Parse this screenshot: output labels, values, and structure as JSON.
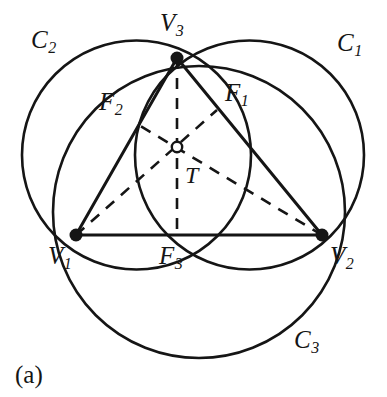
{
  "figure": {
    "caption": "(a)",
    "stroke_color": "#151515",
    "background_color": "#ffffff",
    "canvas": {
      "width": 387,
      "height": 397
    }
  },
  "circles": [
    {
      "id": "C1",
      "label_base": "C",
      "label_sub": "1",
      "label_x": 337,
      "label_y": 30,
      "cx": 249.5,
      "cy": 155,
      "r": 114.5,
      "style": "solid"
    },
    {
      "id": "C2",
      "label_base": "C",
      "label_sub": "2",
      "label_x": 31,
      "label_y": 27,
      "cx": 136.5,
      "cy": 155,
      "r": 114.5,
      "style": "solid"
    },
    {
      "id": "C3",
      "label_base": "C",
      "label_sub": "3",
      "label_x": 294,
      "label_y": 327,
      "cx": 199,
      "cy": 212,
      "r": 146,
      "style": "solid"
    }
  ],
  "vertices": [
    {
      "id": "V1",
      "label_base": "V",
      "label_sub": "1",
      "x": 76,
      "y": 235,
      "label_x": 48,
      "label_y": 243,
      "marker": "filled-dot"
    },
    {
      "id": "V2",
      "label_base": "V",
      "label_sub": "2",
      "x": 322,
      "y": 235,
      "label_x": 330,
      "label_y": 243,
      "marker": "filled-dot"
    },
    {
      "id": "V3",
      "label_base": "V",
      "label_sub": "3",
      "x": 177,
      "y": 58,
      "label_x": 160,
      "label_y": 10,
      "marker": "filled-dot"
    }
  ],
  "intersection_points": [
    {
      "id": "F1",
      "label_base": "F",
      "label_sub": "1",
      "x": 217,
      "y": 110,
      "label_x": 225,
      "label_y": 80,
      "marker": "none"
    },
    {
      "id": "F2",
      "label_base": "F",
      "label_sub": "2",
      "x": 137,
      "y": 124,
      "label_x": 99,
      "label_y": 89,
      "marker": "none"
    },
    {
      "id": "F3",
      "label_base": "F",
      "label_sub": "3",
      "x": 177,
      "y": 235,
      "label_x": 159,
      "label_y": 243,
      "marker": "none"
    }
  ],
  "center_point": {
    "id": "T",
    "label": "T",
    "x": 177,
    "y": 147,
    "label_x": 185,
    "label_y": 163,
    "marker": "open-circle"
  },
  "solid_segments": [
    {
      "name": "V1-V2-baseline",
      "x1": 76,
      "y1": 235,
      "x2": 322,
      "y2": 235
    },
    {
      "name": "V3-V1-side",
      "x1": 177,
      "y1": 58,
      "x2": 76,
      "y2": 235
    },
    {
      "name": "V3-V2-side",
      "x1": 177,
      "y1": 58,
      "x2": 322,
      "y2": 235
    }
  ],
  "dashed_segments": [
    {
      "name": "V3-to-F3-median",
      "x1": 177,
      "y1": 58,
      "x2": 177,
      "y2": 235
    },
    {
      "name": "V1-to-F1-median",
      "x1": 76,
      "y1": 235,
      "x2": 217,
      "y2": 110
    },
    {
      "name": "V2-to-F2-median",
      "x1": 322,
      "y1": 235,
      "x2": 137,
      "y2": 124
    }
  ],
  "legend_note": {
    "solid_meaning": "circle arcs and triangle sides",
    "dashed_meaning": "medians through center T"
  }
}
